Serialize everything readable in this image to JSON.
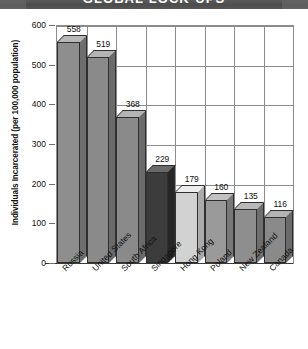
{
  "banner": {
    "title": "GLOBAL LOCK-UPS"
  },
  "chart_data": {
    "type": "bar",
    "title": "GLOBAL LOCK-UPS",
    "xlabel": "",
    "ylabel": "Individuals Incarcerated (per 100,000 population)",
    "ylim": [
      0,
      600
    ],
    "yticks": [
      "0",
      "100",
      "200",
      "300",
      "400",
      "500",
      "600"
    ],
    "grid": true,
    "legend": "none",
    "categories": [
      "Russia",
      "United States",
      "South Africa",
      "Singapore",
      "Hong Kong",
      "Poland",
      "New Zealand",
      "Canada"
    ],
    "values": [
      558,
      519,
      368,
      229,
      179,
      160,
      135,
      116
    ],
    "bar_colors": [
      "#8e8e8e",
      "#8a8a8a",
      "#8a8a8a",
      "#3c3c3c",
      "#d2d2d2",
      "#9a9a9a",
      "#8e8e8e",
      "#8a8a8a"
    ],
    "bar_top_colors": [
      "#b8b8b8",
      "#b4b4b4",
      "#b4b4b4",
      "#6a6a6a",
      "#ededed",
      "#c2c2c2",
      "#b8b8b8",
      "#b4b4b4"
    ],
    "bar_side_colors": [
      "#6e6e6e",
      "#6a6a6a",
      "#6a6a6a",
      "#262626",
      "#ababab",
      "#787878",
      "#6e6e6e",
      "#6a6a6a"
    ]
  },
  "colors": {
    "banner_bg": "#4c4c4c",
    "banner_text": "#ffffff",
    "axis": "#8c8c8c",
    "text": "#111111"
  }
}
